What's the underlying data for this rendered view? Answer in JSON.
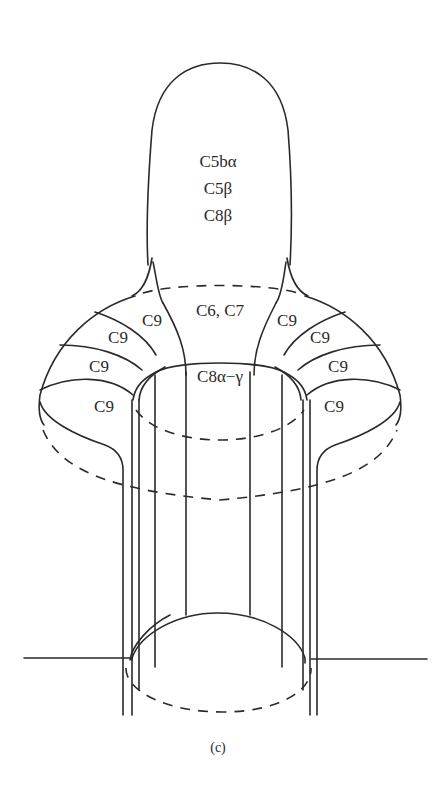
{
  "figure": {
    "caption": "(c)",
    "labels": {
      "bulb_line1": "C5bα",
      "bulb_line2": "C5β",
      "bulb_line3": "C8β",
      "collar_center": "C6, C7",
      "tube_center": "C8α−γ",
      "c9_left_1": "C9",
      "c9_left_2": "C9",
      "c9_left_3": "C9",
      "c9_left_4": "C9",
      "c9_right_1": "C9",
      "c9_right_2": "C9",
      "c9_right_3": "C9",
      "c9_right_4": "C9"
    }
  }
}
